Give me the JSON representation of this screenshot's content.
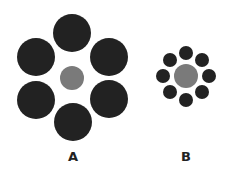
{
  "colors": {
    "outer": "#222222",
    "center": "#7a7a7a",
    "background": "#ffffff"
  },
  "figures": [
    {
      "label": "A",
      "label_pos": [
        73,
        157
      ],
      "center": {
        "cx": 72,
        "cy": 78,
        "r": 12
      },
      "surround_r": 19,
      "surround": [
        [
          72,
          33
        ],
        [
          36,
          57
        ],
        [
          109,
          57
        ],
        [
          36,
          100
        ],
        [
          109,
          99
        ],
        [
          73,
          122
        ]
      ]
    },
    {
      "label": "B",
      "label_pos": [
        186,
        157
      ],
      "center": {
        "cx": 186,
        "cy": 76,
        "r": 12
      },
      "surround_r": 7,
      "surround": [
        [
          186,
          53
        ],
        [
          202,
          60
        ],
        [
          209,
          76
        ],
        [
          202,
          92
        ],
        [
          186,
          100
        ],
        [
          170,
          92
        ],
        [
          163,
          76
        ],
        [
          170,
          60
        ]
      ]
    }
  ]
}
